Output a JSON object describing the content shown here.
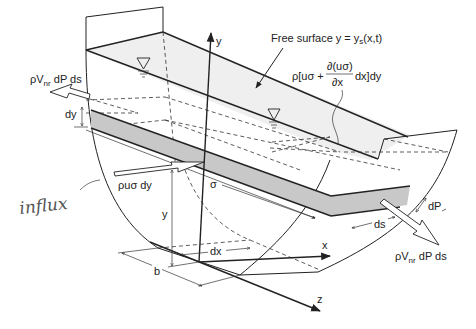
{
  "figure": {
    "type": "3D channel control-volume diagram",
    "colors": {
      "line": "#222222",
      "free_surface_fill": "#efefef",
      "strip_fill": "#c8c8c8",
      "background": "#ffffff",
      "handwriting": "#555555"
    }
  },
  "labels": {
    "free_surface": "Free surface y = y",
    "free_surface_sub": "s",
    "free_surface_args": "(x,t)",
    "outflow_flux_prefix": "ρ[uσ + ",
    "outflow_flux_num": "∂(uσ)",
    "outflow_flux_den": "∂x",
    "outflow_flux_suffix": " dx]dy",
    "inflow_flux": "ρuσ dy",
    "lateral_left_prefix": "ρV",
    "lateral_left_sub": "nr",
    "lateral_left_suffix": " dP ds",
    "lateral_right_prefix": "ρV",
    "lateral_right_sub": "nr",
    "lateral_right_suffix": " dP ds",
    "dy": "dy",
    "dP": "dP",
    "ds": "ds",
    "sigma": "σ",
    "y_dim": "y",
    "dx": "dx",
    "b": "b",
    "handwritten_note": "influx"
  },
  "axes": {
    "x": "x",
    "y": "y",
    "z": "z"
  }
}
